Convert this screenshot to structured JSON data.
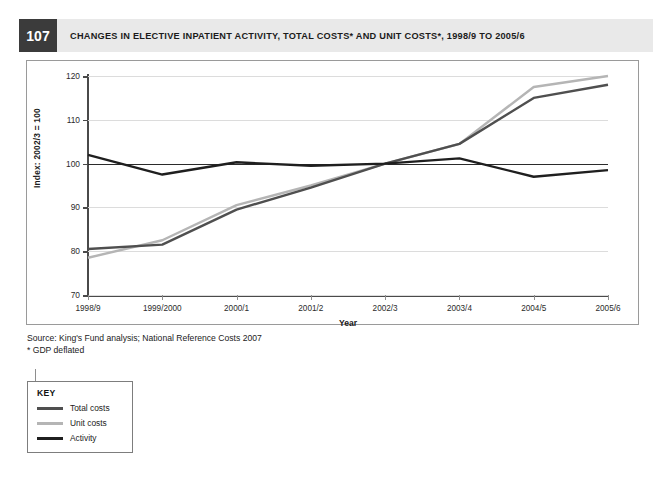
{
  "figure": {
    "number": "107",
    "title": "CHANGES IN ELECTIVE INPATIENT ACTIVITY, TOTAL COSTS* AND UNIT COSTS*, 1998/9 TO 2005/6"
  },
  "source": {
    "line1": "Source: King's Fund analysis; National Reference Costs 2007",
    "line2": "* GDP deflated"
  },
  "key": {
    "title": "KEY",
    "items": [
      {
        "label": "Total costs",
        "color": "#4f4f4f"
      },
      {
        "label": "Unit costs",
        "color": "#b5b5b5"
      },
      {
        "label": "Activity",
        "color": "#1f1f1f"
      }
    ]
  },
  "chart_data": {
    "type": "line",
    "title": "CHANGES IN ELECTIVE INPATIENT ACTIVITY, TOTAL COSTS* AND UNIT COSTS*, 1998/9 TO 2005/6",
    "xlabel": "Year",
    "ylabel": "Index: 2002/3 = 100",
    "categories": [
      "1998/9",
      "1999/2000",
      "2000/1",
      "2001/2",
      "2002/3",
      "2003/4",
      "2004/5",
      "2005/6"
    ],
    "ylim": [
      70,
      120
    ],
    "yticks": [
      70,
      80,
      90,
      100,
      110,
      120
    ],
    "grid": true,
    "reference_line": 100,
    "legend_position": "below-left",
    "series": [
      {
        "name": "Total costs",
        "color": "#4f4f4f",
        "values": [
          80.5,
          81.5,
          89.5,
          94.5,
          100,
          104.5,
          115,
          118
        ]
      },
      {
        "name": "Unit costs",
        "color": "#b5b5b5",
        "values": [
          78.5,
          82.5,
          90.5,
          95,
          100,
          104.5,
          117.5,
          120
        ]
      },
      {
        "name": "Activity",
        "color": "#1f1f1f",
        "values": [
          102,
          97.5,
          100.3,
          99.5,
          100,
          101.2,
          97,
          98.5
        ]
      }
    ]
  }
}
